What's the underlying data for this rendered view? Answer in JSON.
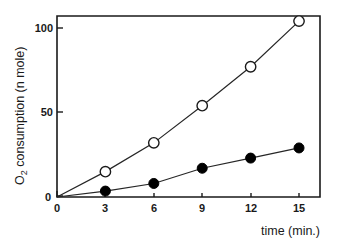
{
  "chart_data": {
    "type": "line",
    "title": "",
    "subtitle": "",
    "xlabel": "time (min.)",
    "ylabel": "O2 consumption (n mole)",
    "ylabel_parts": {
      "pre": "O",
      "sub": "2",
      "post": " consumption (n mole)"
    },
    "x": [
      0,
      3,
      6,
      9,
      12,
      15
    ],
    "xlim": [
      0,
      16.3
    ],
    "ylim": [
      0,
      107
    ],
    "xticks": [
      0,
      3,
      6,
      9,
      12,
      15
    ],
    "xtick_labels": [
      "0",
      "3",
      "6",
      "9",
      "12",
      "15"
    ],
    "yticks": [
      0,
      50,
      100
    ],
    "ytick_labels": [
      "0",
      "50",
      "100"
    ],
    "grid": false,
    "legend": "none",
    "frame": "box",
    "series": [
      {
        "name": "open-circles",
        "marker": "open-circle",
        "color": "#1a1a1a",
        "values": [
          0,
          15,
          32,
          54,
          77,
          104
        ]
      },
      {
        "name": "filled-circles",
        "marker": "filled-circle",
        "color": "#000000",
        "values": [
          0,
          3.5,
          8,
          17,
          23,
          29
        ]
      }
    ]
  },
  "figure": {
    "background": "#ffffff",
    "axis_color": "#1a1a1a"
  }
}
